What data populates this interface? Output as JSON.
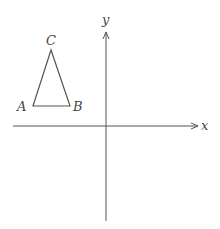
{
  "diagram": {
    "type": "coordinate-plane-with-triangle",
    "axes": {
      "x_label": "x",
      "y_label": "y",
      "origin_px": [
        106,
        126
      ]
    },
    "triangle": {
      "vertices": [
        {
          "name": "A",
          "px": [
            33,
            106
          ]
        },
        {
          "name": "B",
          "px": [
            70,
            106
          ]
        },
        {
          "name": "C",
          "px": [
            51,
            50
          ]
        }
      ],
      "labels": {
        "A": "A",
        "B": "B",
        "C": "C"
      }
    },
    "colors": {
      "stroke": "#555555",
      "text": "#444444",
      "background": "#ffffff"
    }
  }
}
